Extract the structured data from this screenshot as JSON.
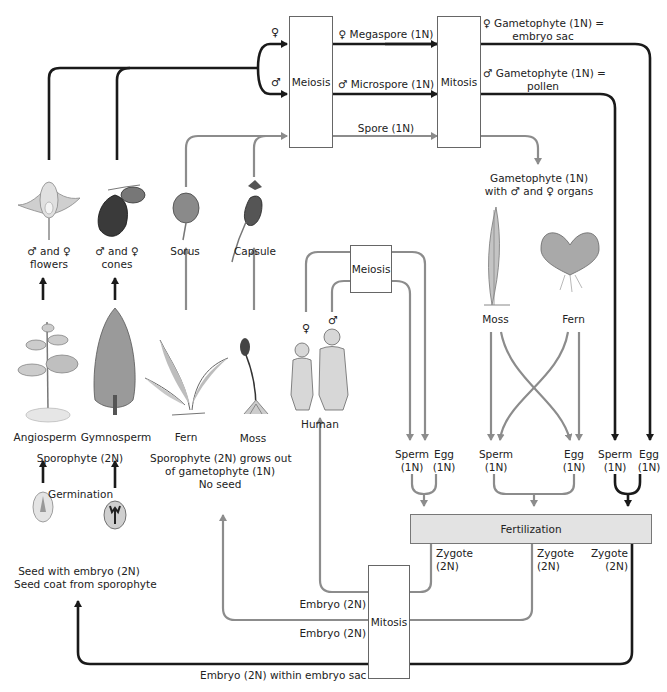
{
  "colors": {
    "black_line": "#1a1a1a",
    "gray_line": "#8c8c8c",
    "box_fill": "#ffffff",
    "fertilization_fill": "#e3e3e3",
    "text": "#222222"
  },
  "process_boxes": {
    "meiosis_top": "Meiosis",
    "mitosis_top": "Mitosis",
    "meiosis_human": "Meiosis",
    "fertilization": "Fertilization",
    "mitosis_bottom": "Mitosis"
  },
  "top_flow": {
    "female_symbol": "♀",
    "male_symbol": "♂",
    "megaspore": "♀ Megaspore (1N)",
    "microspore": "♂ Microspore (1N)",
    "spore": "Spore (1N)",
    "female_gametophyte_line1": "♀ Gametophyte (1N) =",
    "female_gametophyte_line2": "embryo sac",
    "male_gametophyte_line1": "♂ Gametophyte (1N) =",
    "male_gametophyte_line2": "pollen",
    "gametophyte_line1": "Gametophyte (1N)",
    "gametophyte_line2": "with ♂ and ♀ organs"
  },
  "reproductive_structures": {
    "flowers_line1": "♂ and ♀",
    "flowers_line2": "flowers",
    "cones_line1": "♂ and ♀",
    "cones_line2": "cones",
    "sorus": "Sorus",
    "capsule": "Capsule"
  },
  "organisms": {
    "angiosperm": "Angiosperm",
    "gymnosperm": "Gymnosperm",
    "fern": "Fern",
    "moss": "Moss",
    "human": "Human",
    "human_female": "♀",
    "human_male": "♂",
    "gametophyte_moss": "Moss",
    "gametophyte_fern": "Fern"
  },
  "notes": {
    "sporophyte": "Sporophyte (2N)",
    "germination": "Germination",
    "sporophyte_grows_line1": "Sporophyte (2N) grows out",
    "sporophyte_grows_line2": "of gametophyte (1N)",
    "sporophyte_grows_line3": "No seed",
    "seed_line1": "Seed with embryo (2N)",
    "seed_line2": "Seed coat from sporophyte"
  },
  "gametes": [
    {
      "name": "Sperm",
      "ploidy": "(1N)"
    },
    {
      "name": "Egg",
      "ploidy": "(1N)"
    },
    {
      "name": "Sperm",
      "ploidy": "(1N)"
    },
    {
      "name": "Egg",
      "ploidy": "(1N)"
    },
    {
      "name": "Sperm",
      "ploidy": "(1N)"
    },
    {
      "name": "Egg",
      "ploidy": "(1N)"
    }
  ],
  "zygotes": [
    {
      "name": "Zygote",
      "ploidy": "(2N)"
    },
    {
      "name": "Zygote",
      "ploidy": "(2N)"
    },
    {
      "name": "Zygote",
      "ploidy": "(2N)"
    }
  ],
  "embryos": {
    "human": "Embryo (2N)",
    "plant": "Embryo (2N)",
    "seed": "Embryo (2N) within embryo sac"
  }
}
